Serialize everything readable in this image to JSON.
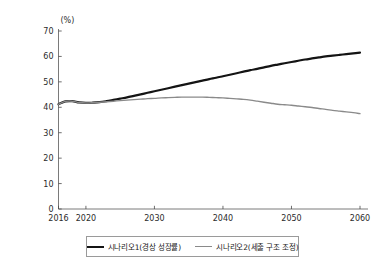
{
  "chart_data": {
    "type": "line",
    "title": "",
    "subtitle": "",
    "xlabel": "",
    "ylabel": "",
    "unit_label": "(%)",
    "xlim": [
      2016,
      2060
    ],
    "ylim": [
      0,
      70
    ],
    "yticks": [
      0,
      10,
      20,
      30,
      40,
      50,
      60,
      70
    ],
    "ytick_labels": [
      "0",
      "10",
      "20",
      "30",
      "40",
      "50",
      "60",
      "70"
    ],
    "xticks": [
      2016,
      2020,
      2030,
      2040,
      2050,
      2060
    ],
    "xtick_labels": [
      "2016",
      "2020",
      "2030",
      "2040",
      "2050",
      "2060"
    ],
    "grid": false,
    "legend_position": "bottom",
    "x": [
      2016,
      2017,
      2018,
      2019,
      2020,
      2021,
      2022,
      2023,
      2024,
      2025,
      2026,
      2027,
      2028,
      2029,
      2030,
      2031,
      2032,
      2033,
      2034,
      2035,
      2036,
      2037,
      2038,
      2039,
      2040,
      2041,
      2042,
      2043,
      2044,
      2045,
      2046,
      2047,
      2048,
      2049,
      2050,
      2051,
      2052,
      2053,
      2054,
      2055,
      2056,
      2057,
      2058,
      2059,
      2060
    ],
    "series": [
      {
        "name": "시나리오1(경상 성장률)",
        "color": "#141414",
        "width": 2.2,
        "values": [
          41.2,
          42.3,
          42.4,
          41.9,
          41.7,
          41.8,
          42.0,
          42.4,
          42.9,
          43.4,
          43.9,
          44.5,
          45.1,
          45.7,
          46.3,
          46.9,
          47.5,
          48.1,
          48.7,
          49.3,
          49.9,
          50.5,
          51.1,
          51.6,
          52.2,
          52.8,
          53.4,
          54.0,
          54.6,
          55.1,
          55.7,
          56.3,
          56.8,
          57.3,
          57.8,
          58.3,
          58.8,
          59.2,
          59.6,
          60.0,
          60.3,
          60.6,
          60.9,
          61.2,
          61.5
        ]
      },
      {
        "name": "시나리오2(세출 구조 조정)",
        "color": "#8a8a8a",
        "width": 1.4,
        "values": [
          41.2,
          42.3,
          42.4,
          41.9,
          41.7,
          41.8,
          42.0,
          42.2,
          42.4,
          42.6,
          42.8,
          43.0,
          43.2,
          43.4,
          43.5,
          43.7,
          43.8,
          43.9,
          44.0,
          44.0,
          44.0,
          44.0,
          43.9,
          43.8,
          43.7,
          43.5,
          43.3,
          43.1,
          42.8,
          42.4,
          42.0,
          41.6,
          41.2,
          41.0,
          40.8,
          40.5,
          40.2,
          39.9,
          39.5,
          39.2,
          38.8,
          38.5,
          38.2,
          37.9,
          37.5
        ]
      }
    ]
  },
  "legend": {
    "entries": [
      {
        "label": "시나리오1(경상 성장률)"
      },
      {
        "label": "시나리오2(세출 구조 조정)"
      }
    ]
  }
}
